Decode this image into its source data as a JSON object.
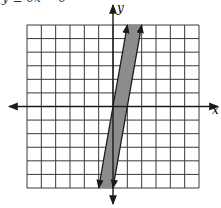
{
  "header": {
    "cut_text": "y ≥ 6x − 6"
  },
  "chart_data": {
    "type": "line",
    "title": "",
    "xlabel": "x",
    "ylabel": "y",
    "xlim": [
      -6,
      6
    ],
    "ylim": [
      -6,
      6
    ],
    "grid": true,
    "grid_step": 1,
    "series": [
      {
        "name": "boundary-left",
        "equation": "y = 6x",
        "x": [
          -1,
          1
        ],
        "y": [
          -6,
          6
        ],
        "style": "solid",
        "arrows": true
      },
      {
        "name": "boundary-right",
        "equation": "y = 6x - 6",
        "x": [
          0,
          2
        ],
        "y": [
          -6,
          6
        ],
        "style": "solid",
        "arrows": true
      }
    ],
    "shaded_region": {
      "description": "6x - 6 <= y <= 6x",
      "color": "#8c8c8c"
    }
  },
  "colors": {
    "grid": "#3a3a3a",
    "axis": "#1a1a1a",
    "shade": "#8c8c8c"
  }
}
